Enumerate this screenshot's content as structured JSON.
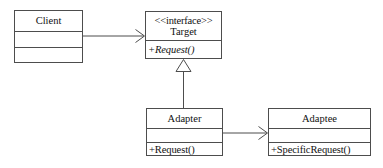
{
  "diagram": {
    "kind": "uml-class-diagram",
    "background_color": "#ffffff",
    "line_color": "#4d4d4d",
    "text_color": "#111111",
    "classes": [
      {
        "id": "client",
        "name": "Client",
        "stereotype": "",
        "attributes": "",
        "operations": "",
        "compartments": 3
      },
      {
        "id": "target",
        "name": "Target",
        "stereotype": "<<interface>>",
        "operations": "+Request()",
        "operations_abstract": true,
        "compartments": 2
      },
      {
        "id": "adapter",
        "name": "Adapter",
        "stereotype": "",
        "attributes": "",
        "operations": "+Request()",
        "operations_abstract": false,
        "compartments": 3
      },
      {
        "id": "adaptee",
        "name": "Adaptee",
        "stereotype": "",
        "attributes": "",
        "operations": "+SpecificRequest()",
        "operations_abstract": false,
        "compartments": 3
      }
    ],
    "relationships": [
      {
        "id": "client-target",
        "from": "client",
        "to": "target",
        "type": "association",
        "arrowhead": "open",
        "label": ""
      },
      {
        "id": "adapter-target",
        "from": "adapter",
        "to": "target",
        "type": "realization",
        "arrowhead": "hollow-triangle",
        "label": ""
      },
      {
        "id": "adapter-adaptee",
        "from": "adapter",
        "to": "adaptee",
        "type": "association",
        "arrowhead": "open",
        "label": ""
      }
    ]
  }
}
